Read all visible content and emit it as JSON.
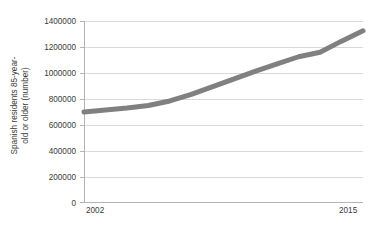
{
  "chart_data": {
    "type": "line",
    "title": "",
    "xlabel": "",
    "ylabel": "Spanish residents 85-year-old or older (number)",
    "ylabel_lines": [
      "Spanish residents 85-year-",
      "old or older (number)"
    ],
    "x": [
      2002,
      2003,
      2004,
      2005,
      2006,
      2007,
      2008,
      2009,
      2010,
      2011,
      2012,
      2013,
      2014,
      2015
    ],
    "values": [
      700000,
      715000,
      730000,
      750000,
      785000,
      835000,
      895000,
      955000,
      1015000,
      1070000,
      1125000,
      1160000,
      1245000,
      1325000
    ],
    "series": [
      {
        "name": "Spanish residents 85-year-old or older (number)",
        "color": "#808080",
        "values": [
          700000,
          715000,
          730000,
          750000,
          785000,
          835000,
          895000,
          955000,
          1015000,
          1070000,
          1125000,
          1160000,
          1245000,
          1325000
        ]
      }
    ],
    "ylim": [
      0,
      1400000
    ],
    "xlim": [
      2002,
      2015
    ],
    "y_ticks": [
      0,
      200000,
      400000,
      600000,
      800000,
      1000000,
      1200000,
      1400000
    ],
    "y_tick_labels": [
      "0",
      "200000",
      "400000",
      "600000",
      "800000",
      "1000000",
      "1200000",
      "1400000"
    ],
    "x_ticks": [
      2002,
      2015
    ],
    "x_tick_labels": [
      "2002",
      "2015"
    ],
    "grid": true,
    "grid_color": "#d9d9d9",
    "axis_color": "#b4b4b4",
    "legend": false,
    "legend_position": "none",
    "background": "#ffffff",
    "line_color": "#808080",
    "line_width": 5,
    "markers": false
  }
}
